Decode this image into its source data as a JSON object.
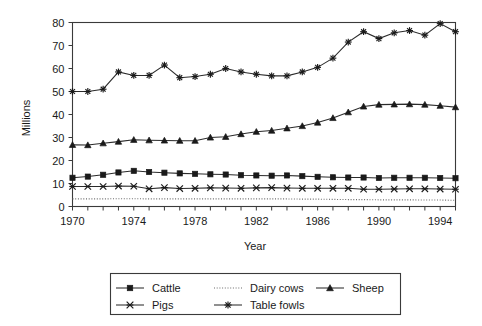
{
  "chart_data": {
    "type": "line",
    "title": "",
    "xlabel": "Year",
    "ylabel": "Millions",
    "xlim": [
      1970,
      1995
    ],
    "ylim": [
      0,
      80
    ],
    "grid": false,
    "legend_position": "bottom",
    "x": [
      1970,
      1971,
      1972,
      1973,
      1974,
      1975,
      1976,
      1977,
      1978,
      1979,
      1980,
      1981,
      1982,
      1983,
      1984,
      1985,
      1986,
      1987,
      1988,
      1989,
      1990,
      1991,
      1992,
      1993,
      1994,
      1995
    ],
    "xticks": [
      1970,
      1974,
      1978,
      1982,
      1986,
      1990,
      1994
    ],
    "xtick_labels": [
      "1970",
      "1974",
      "1978",
      "1982",
      "1986",
      "1990",
      "1994"
    ],
    "yticks": [
      0,
      10,
      20,
      30,
      40,
      50,
      60,
      70,
      80
    ],
    "ytick_labels": [
      "0",
      "10",
      "20",
      "30",
      "40",
      "50",
      "60",
      "70",
      "80"
    ],
    "series": [
      {
        "name": "Cattle",
        "marker": "filled-square",
        "linestyle": "solid",
        "values": [
          12.5,
          13.0,
          13.8,
          14.8,
          15.5,
          15.0,
          14.7,
          14.4,
          14.2,
          14.0,
          13.9,
          13.6,
          13.5,
          13.4,
          13.5,
          13.2,
          12.9,
          12.7,
          12.6,
          12.6,
          12.4,
          12.5,
          12.5,
          12.5,
          12.4,
          12.3
        ]
      },
      {
        "name": "Dairy cows",
        "marker": "none",
        "linestyle": "dotted",
        "values": [
          3.3,
          3.3,
          3.3,
          3.4,
          3.4,
          3.3,
          3.3,
          3.3,
          3.3,
          3.3,
          3.3,
          3.3,
          3.3,
          3.3,
          3.3,
          3.2,
          3.2,
          3.1,
          3.0,
          3.0,
          2.9,
          2.9,
          2.9,
          2.8,
          2.8,
          2.7
        ]
      },
      {
        "name": "Sheep",
        "marker": "filled-triangle",
        "linestyle": "solid",
        "values": [
          26.8,
          26.7,
          27.5,
          28.2,
          29.0,
          28.8,
          28.7,
          28.6,
          28.6,
          30.0,
          30.3,
          31.5,
          32.5,
          33.0,
          34.0,
          35.0,
          36.5,
          38.5,
          41.0,
          43.5,
          44.3,
          44.4,
          44.5,
          44.3,
          43.8,
          43.2
        ]
      },
      {
        "name": "Pigs",
        "marker": "x-star",
        "linestyle": "solid",
        "values": [
          8.7,
          8.7,
          8.7,
          8.9,
          8.8,
          7.7,
          8.2,
          7.8,
          7.9,
          8.1,
          8.0,
          7.9,
          8.1,
          8.2,
          8.0,
          7.9,
          7.9,
          7.9,
          7.9,
          7.5,
          7.5,
          7.6,
          7.7,
          7.7,
          7.6,
          7.5
        ]
      },
      {
        "name": "Table fowls",
        "marker": "asterisk",
        "linestyle": "solid",
        "values": [
          50.0,
          50.0,
          51.0,
          58.5,
          57.0,
          57.0,
          61.5,
          56.0,
          56.5,
          57.5,
          60.0,
          58.5,
          57.5,
          56.8,
          56.8,
          58.5,
          60.5,
          64.5,
          71.5,
          76.0,
          73.0,
          75.5,
          76.5,
          74.5,
          79.5,
          76.0
        ]
      }
    ]
  },
  "legend": {
    "entries": [
      {
        "label": "Cattle",
        "marker": "filled-square"
      },
      {
        "label": "Dairy cows",
        "marker": "dotted"
      },
      {
        "label": "Sheep",
        "marker": "filled-triangle"
      },
      {
        "label": "Pigs",
        "marker": "x-star"
      },
      {
        "label": "Table fowls",
        "marker": "asterisk"
      }
    ]
  }
}
